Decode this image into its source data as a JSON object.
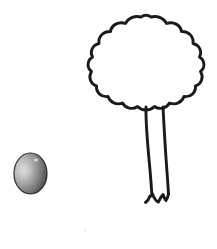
{
  "scene": {
    "title": "Tree and ball line illustration",
    "background_color": "#ffffff",
    "stroke_color": "#1a1a1a",
    "top_faint_text": "··  ··",
    "objects": [
      {
        "name": "tree",
        "label": "tree",
        "parts": [
          "canopy",
          "trunk",
          "roots"
        ],
        "style": "black outline, unfilled",
        "fill_color": "#ffffff",
        "stroke_color": "#1a1a1a",
        "stroke_width": 3,
        "bounds": {
          "x": 100,
          "y": 16,
          "width": 106,
          "height": 192
        }
      },
      {
        "name": "ball",
        "label": "ball",
        "style": "shaded sphere with gradient",
        "highlight_color": "#d8d8d8",
        "midtone_color": "#8e8e8e",
        "shadow_color": "#3a3a3a",
        "stroke_color": "#2b2b2b",
        "stroke_width": 1,
        "bounds": {
          "x": 14,
          "y": 153,
          "width": 33,
          "height": 41
        }
      }
    ]
  }
}
